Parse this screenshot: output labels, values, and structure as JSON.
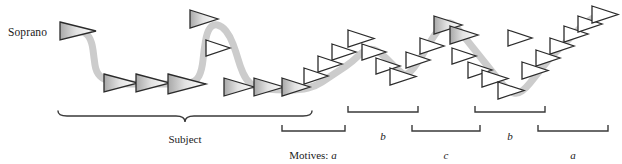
{
  "figure": {
    "voice_label": "Soprano",
    "subject_label": "Subject",
    "motives_prefix": "Motives:",
    "motives_first_letter": "a",
    "colors": {
      "contour_line": "#cccccc",
      "notehead_outline": "#2b2b2b",
      "notehead_fill_light": "#f7f7f7",
      "notehead_fill_dark": "#b8b8b8",
      "bracket": "#3a3a3a",
      "text": "#1a1a1a",
      "background": "#ffffff"
    },
    "brackets": [
      {
        "id": "subject",
        "type": "brace",
        "label": "Subject",
        "x1": 58,
        "x2": 312,
        "y": 116,
        "label_x": 185,
        "label_y": 134
      },
      {
        "id": "motive-a1",
        "type": "square",
        "label": "a",
        "prefix": "Motives:",
        "x1": 282,
        "x2": 345,
        "y": 131,
        "label_x": 313,
        "label_y": 150
      },
      {
        "id": "motive-b1",
        "type": "square",
        "label": "b",
        "x1": 348,
        "x2": 418,
        "y": 112,
        "label_x": 383,
        "label_y": 131
      },
      {
        "id": "motive-c",
        "type": "square",
        "label": "c",
        "x1": 412,
        "x2": 480,
        "y": 131,
        "label_x": 446,
        "label_y": 150
      },
      {
        "id": "motive-b2",
        "type": "square",
        "label": "b",
        "x1": 475,
        "x2": 545,
        "y": 112,
        "label_x": 510,
        "label_y": 131
      },
      {
        "id": "motive-a2",
        "type": "square",
        "label": "a",
        "x1": 538,
        "x2": 608,
        "y": 131,
        "label_x": 573,
        "label_y": 150
      }
    ],
    "contour_points": [
      [
        72,
        30
      ],
      [
        86,
        32
      ],
      [
        92,
        42
      ],
      [
        94,
        58
      ],
      [
        96,
        72
      ],
      [
        104,
        80
      ],
      [
        120,
        84
      ],
      [
        150,
        84
      ],
      [
        180,
        84
      ],
      [
        196,
        82
      ],
      [
        202,
        70
      ],
      [
        204,
        50
      ],
      [
        207,
        32
      ],
      [
        213,
        24
      ],
      [
        222,
        26
      ],
      [
        230,
        36
      ],
      [
        236,
        52
      ],
      [
        240,
        66
      ],
      [
        246,
        80
      ],
      [
        256,
        88
      ],
      [
        276,
        90
      ],
      [
        300,
        90
      ],
      [
        316,
        86
      ],
      [
        328,
        78
      ],
      [
        340,
        70
      ],
      [
        352,
        62
      ],
      [
        362,
        52
      ],
      [
        372,
        48
      ],
      [
        382,
        54
      ],
      [
        390,
        62
      ],
      [
        398,
        70
      ],
      [
        406,
        76
      ],
      [
        414,
        68
      ],
      [
        422,
        56
      ],
      [
        430,
        42
      ],
      [
        438,
        30
      ],
      [
        446,
        22
      ],
      [
        454,
        24
      ],
      [
        462,
        34
      ],
      [
        470,
        44
      ],
      [
        478,
        54
      ],
      [
        486,
        64
      ],
      [
        494,
        74
      ],
      [
        502,
        84
      ],
      [
        510,
        92
      ],
      [
        518,
        94
      ],
      [
        526,
        88
      ],
      [
        534,
        78
      ],
      [
        542,
        68
      ],
      [
        550,
        58
      ],
      [
        558,
        50
      ],
      [
        566,
        42
      ],
      [
        574,
        34
      ],
      [
        582,
        26
      ],
      [
        592,
        18
      ],
      [
        602,
        14
      ]
    ],
    "noteheads": [
      {
        "x": 60,
        "y": 22,
        "w": 36,
        "h": 18,
        "size": "large"
      },
      {
        "x": 104,
        "y": 74,
        "w": 34,
        "h": 18,
        "size": "large"
      },
      {
        "x": 136,
        "y": 74,
        "w": 34,
        "h": 18,
        "size": "large"
      },
      {
        "x": 168,
        "y": 74,
        "w": 38,
        "h": 20,
        "size": "large"
      },
      {
        "x": 190,
        "y": 10,
        "w": 28,
        "h": 18,
        "size": "medium"
      },
      {
        "x": 206,
        "y": 40,
        "w": 24,
        "h": 16,
        "size": "small"
      },
      {
        "x": 224,
        "y": 78,
        "w": 30,
        "h": 18,
        "size": "medium"
      },
      {
        "x": 254,
        "y": 78,
        "w": 30,
        "h": 18,
        "size": "medium"
      },
      {
        "x": 282,
        "y": 78,
        "w": 28,
        "h": 18,
        "size": "medium"
      },
      {
        "x": 304,
        "y": 68,
        "w": 24,
        "h": 16,
        "size": "small"
      },
      {
        "x": 318,
        "y": 56,
        "w": 24,
        "h": 16,
        "size": "small"
      },
      {
        "x": 332,
        "y": 44,
        "w": 24,
        "h": 16,
        "size": "small"
      },
      {
        "x": 348,
        "y": 30,
        "w": 26,
        "h": 17,
        "size": "small"
      },
      {
        "x": 362,
        "y": 44,
        "w": 24,
        "h": 16,
        "size": "small"
      },
      {
        "x": 376,
        "y": 58,
        "w": 24,
        "h": 16,
        "size": "small"
      },
      {
        "x": 390,
        "y": 68,
        "w": 26,
        "h": 17,
        "size": "small"
      },
      {
        "x": 406,
        "y": 52,
        "w": 24,
        "h": 16,
        "size": "small"
      },
      {
        "x": 420,
        "y": 38,
        "w": 24,
        "h": 16,
        "size": "small"
      },
      {
        "x": 434,
        "y": 16,
        "w": 28,
        "h": 18,
        "size": "medium"
      },
      {
        "x": 450,
        "y": 26,
        "w": 28,
        "h": 18,
        "size": "medium"
      },
      {
        "x": 452,
        "y": 48,
        "w": 24,
        "h": 16,
        "size": "small"
      },
      {
        "x": 468,
        "y": 62,
        "w": 24,
        "h": 16,
        "size": "small"
      },
      {
        "x": 482,
        "y": 70,
        "w": 26,
        "h": 17,
        "size": "small"
      },
      {
        "x": 498,
        "y": 82,
        "w": 26,
        "h": 17,
        "size": "small"
      },
      {
        "x": 508,
        "y": 30,
        "w": 24,
        "h": 16,
        "size": "small"
      },
      {
        "x": 522,
        "y": 62,
        "w": 26,
        "h": 17,
        "size": "small"
      },
      {
        "x": 536,
        "y": 50,
        "w": 24,
        "h": 16,
        "size": "small"
      },
      {
        "x": 550,
        "y": 38,
        "w": 24,
        "h": 16,
        "size": "small"
      },
      {
        "x": 564,
        "y": 26,
        "w": 24,
        "h": 16,
        "size": "small"
      },
      {
        "x": 578,
        "y": 16,
        "w": 24,
        "h": 16,
        "size": "small"
      },
      {
        "x": 592,
        "y": 6,
        "w": 26,
        "h": 17,
        "size": "small"
      }
    ]
  }
}
